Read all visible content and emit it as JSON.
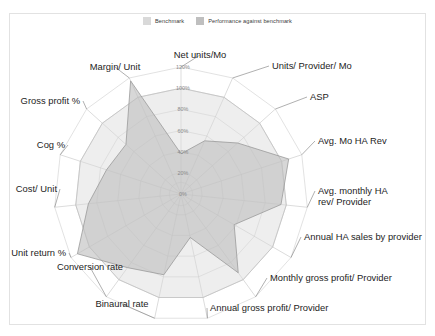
{
  "legend": {
    "items": [
      {
        "label": "Benchmark",
        "color": "#d9d9d9",
        "name": "legend-benchmark"
      },
      {
        "label": "Performance against benchmark",
        "color": "#bfbfbf",
        "name": "legend-performance"
      }
    ]
  },
  "chart_data": {
    "type": "radar",
    "title": "",
    "xlabel": "",
    "ylabel": "",
    "rlim": [
      0,
      120
    ],
    "r_tick_labels": [
      "0%",
      "20%",
      "40%",
      "60%",
      "80%",
      "100%",
      "120%"
    ],
    "r_ticks": [
      0,
      20,
      40,
      60,
      80,
      100,
      120
    ],
    "grid": true,
    "legend_position": "top-center",
    "categories": [
      "Net units/Mo",
      "Units/ Provider/ Mo",
      "ASP",
      "Avg. Mo HA Rev",
      "Avg. monthly HA rev/ Provider",
      "Annual HA sales by provider",
      "Monthly gross profit/ Provider",
      "Annual gross profit/ Provider",
      "Binaural rate",
      "Conversion rate",
      "Unit return %",
      "Cost/ Unit",
      "Cog %",
      "Gross profit %",
      "Margin/ Unit"
    ],
    "series": [
      {
        "name": "Benchmark",
        "color": "#d9d9d9",
        "values": [
          100,
          100,
          100,
          100,
          100,
          100,
          100,
          100,
          100,
          100,
          100,
          100,
          100,
          100,
          100
        ]
      },
      {
        "name": "Performance against benchmark",
        "color": "#bfbfbf",
        "values": [
          38,
          55,
          72,
          107,
          95,
          58,
          92,
          42,
          78,
          86,
          113,
          88,
          74,
          70,
          117
        ]
      }
    ]
  }
}
